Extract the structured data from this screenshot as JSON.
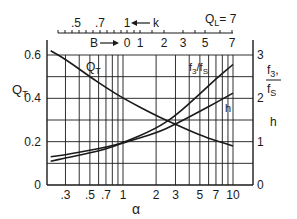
{
  "chart_data": {
    "type": "line",
    "title": "",
    "annotation": "QL = 7",
    "x_axis": {
      "label": "α",
      "scale": "log",
      "ticks": [
        ".3",
        ".5",
        ".7",
        "1",
        "2",
        "3",
        "5",
        "7",
        "10"
      ],
      "tick_values": [
        0.3,
        0.5,
        0.7,
        1,
        2,
        3,
        5,
        7,
        10
      ],
      "range": [
        0.2,
        15
      ]
    },
    "left_axis": {
      "label": "QT",
      "ticks": [
        "0",
        "0.2",
        "0.4",
        "0.6"
      ],
      "range": [
        0,
        0.6
      ]
    },
    "right_axis": {
      "label_top": "f3/fS,",
      "label_bottom": "h",
      "ticks": [
        "0",
        "1",
        "2",
        "3"
      ],
      "range": [
        0,
        3
      ]
    },
    "top_scales": {
      "k": {
        "label": "k",
        "ticks": [
          ".5",
          ".7",
          "1"
        ]
      },
      "B": {
        "label": "B",
        "ticks": [
          "0",
          "1",
          "2",
          "3",
          "5",
          "7"
        ]
      }
    },
    "grid": true,
    "series": [
      {
        "name": "QT",
        "axis": "left",
        "x": [
          0.22,
          0.3,
          0.5,
          0.7,
          1,
          2,
          3,
          5,
          7,
          10
        ],
        "y": [
          0.62,
          0.58,
          0.5,
          0.45,
          0.4,
          0.32,
          0.28,
          0.23,
          0.205,
          0.18
        ]
      },
      {
        "name": "f3/fS",
        "axis": "right",
        "x": [
          0.22,
          0.3,
          0.5,
          0.7,
          1,
          2,
          3,
          5,
          7,
          10
        ],
        "y": [
          0.65,
          0.7,
          0.8,
          0.87,
          0.97,
          1.3,
          1.6,
          2.1,
          2.45,
          2.78
        ]
      },
      {
        "name": "h",
        "axis": "right",
        "x": [
          0.22,
          0.3,
          0.5,
          0.7,
          1,
          2,
          3,
          5,
          7,
          10
        ],
        "y": [
          0.55,
          0.62,
          0.74,
          0.83,
          0.97,
          1.2,
          1.4,
          1.7,
          1.9,
          2.12
        ]
      }
    ]
  },
  "labels": {
    "ql": "Q",
    "ql_sub": "L",
    "ql_val": "= 7",
    "qt": "Q",
    "qt_sub": "T",
    "qt_curve": "Q",
    "qt_curve_sub": "T",
    "f3fs_curve": "f3/fS",
    "h_curve": "h",
    "right_f3": "f3",
    "right_fs": "fS",
    "right_h": "h",
    "alpha": "α",
    "k_arrow_label": "k",
    "b_arrow_label": "B"
  }
}
